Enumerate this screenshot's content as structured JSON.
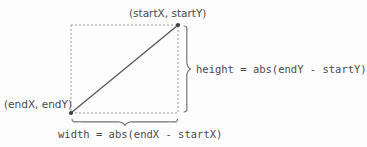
{
  "diagram": {
    "colors": {
      "background": "#fdfdfd",
      "text": "#4a4a4a",
      "line": "#55575a",
      "dashed_guide": "#9a9a9a",
      "brace": "#6e7073",
      "point_marker": "#3b3d40"
    },
    "labels": {
      "start_point": "(startX, startY)",
      "end_point": "(endX, endY)",
      "height_formula": "height = abs(endY - startY)",
      "width_formula": "width = abs(endX - startX)"
    },
    "geometry": {
      "rect": {
        "x": 71,
        "y": 25,
        "width": 107,
        "height": 88
      },
      "start_point": {
        "x": 178,
        "y": 25
      },
      "end_point": {
        "x": 71,
        "y": 113
      },
      "diagonal": {
        "x1": 71,
        "y1": 113,
        "x2": 178,
        "y2": 25
      },
      "height_brace": {
        "x": 184,
        "y_top": 25,
        "y_bottom": 113,
        "tip_y": 69
      },
      "width_brace": {
        "y": 119,
        "x_left": 71,
        "x_right": 178,
        "tip_x": 125
      }
    }
  }
}
